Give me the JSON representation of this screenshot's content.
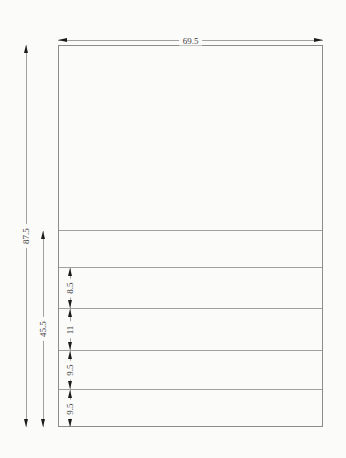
{
  "dims": {
    "width": "69.5",
    "total_height": "87.5",
    "lower_height": "45.5",
    "sections": [
      "8.5",
      "11",
      "9.5",
      "9.5"
    ]
  },
  "colors": {
    "bg": "#fbfbfa",
    "line": "#a0a0a0",
    "edge": "#8c8c8c",
    "arrow": "#1c1c1c",
    "ink": "#3c3c3c"
  }
}
